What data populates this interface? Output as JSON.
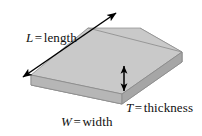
{
  "figure": {
    "caption": "",
    "background_color": "#ffffff",
    "width": 202,
    "height": 136
  },
  "solid": {
    "name": "rectangular-block",
    "faces": {
      "top": {
        "label": "top-face",
        "color": "#c9c9c9"
      },
      "front": {
        "label": "front-face",
        "color": "#b4b4b4"
      },
      "right_end": {
        "label": "right-end-face",
        "color": "#a8a8a8"
      }
    },
    "edge_color": "#7a7a7a"
  },
  "labels": {
    "length": {
      "symbol": "L",
      "equals": "=",
      "word": "length",
      "full_text": "L = length"
    },
    "thickness": {
      "symbol": "T",
      "equals": "=",
      "word": "thickness",
      "full_text": "T = thickness"
    },
    "width": {
      "symbol": "W",
      "equals": "=",
      "word": "width",
      "full_text": "W = width"
    }
  },
  "annotations": {
    "length_arrow": {
      "name": "length-dimension-arrow",
      "style": "double-headed",
      "color": "#000000",
      "x1": 23,
      "y1": 77,
      "x2": 116,
      "y2": 13
    },
    "thickness_arrow": {
      "name": "thickness-dimension-arrow",
      "style": "double-headed",
      "color": "#000000",
      "x1": 124,
      "y1": 66,
      "x2": 124,
      "y2": 91
    }
  }
}
